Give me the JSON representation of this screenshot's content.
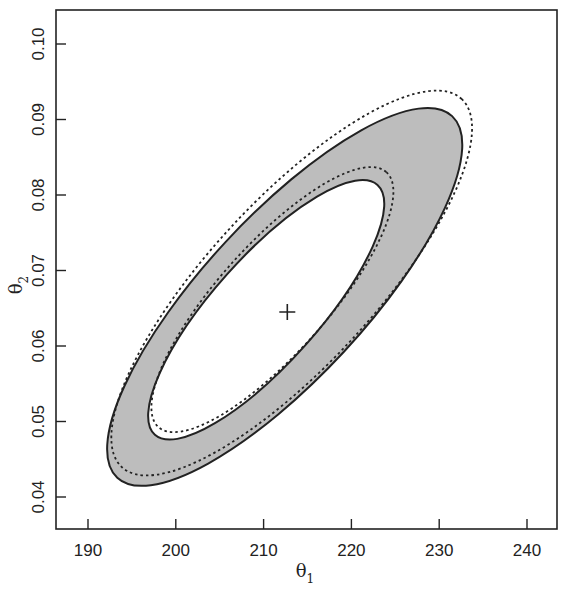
{
  "chart_data": {
    "type": "contour",
    "title": "",
    "xlabel": "θ1",
    "ylabel": "θ2",
    "xlim": [
      186,
      243.5
    ],
    "ylim": [
      0.0363,
      0.1045
    ],
    "x_ticks": [
      190,
      200,
      210,
      220,
      230,
      240
    ],
    "y_ticks": [
      0.04,
      0.05,
      0.06,
      0.07,
      0.08,
      0.09,
      0.1
    ],
    "x_tick_labels": [
      "190",
      "200",
      "210",
      "220",
      "230",
      "240"
    ],
    "y_tick_labels": [
      "0.04",
      "0.05",
      "0.06",
      "0.07",
      "0.08",
      "0.09",
      "0.10"
    ],
    "grid": false,
    "legend": null,
    "point_estimate": {
      "marker": "+",
      "x": 212.7,
      "y": 0.0645
    },
    "regions": [
      {
        "name": "outer-solid-contour",
        "style": "solid",
        "fill": "#bdbdbd",
        "x_range": [
          192.2,
          232.6
        ],
        "y_range": [
          0.0415,
          0.0915
        ]
      },
      {
        "name": "inner-solid-contour",
        "style": "solid",
        "fill": "#ffffff",
        "x_range": [
          196.5,
          224.1
        ],
        "y_range": [
          0.048,
          0.0816
        ]
      },
      {
        "name": "outer-dashed-contour",
        "style": "dashed",
        "x_range": [
          192.7,
          233.7
        ],
        "y_range": [
          0.0428,
          0.0939
        ]
      },
      {
        "name": "inner-dashed-contour",
        "style": "dashed",
        "x_range": [
          197.0,
          225.0
        ],
        "y_range": [
          0.049,
          0.0833
        ]
      }
    ],
    "colors": {
      "band_fill": "#bdbdbd",
      "line": "#222222",
      "background": "#ffffff"
    }
  },
  "axes": {
    "xlabel_main": "θ",
    "xlabel_sub": "1",
    "ylabel_main": "θ",
    "ylabel_sub": "2"
  }
}
